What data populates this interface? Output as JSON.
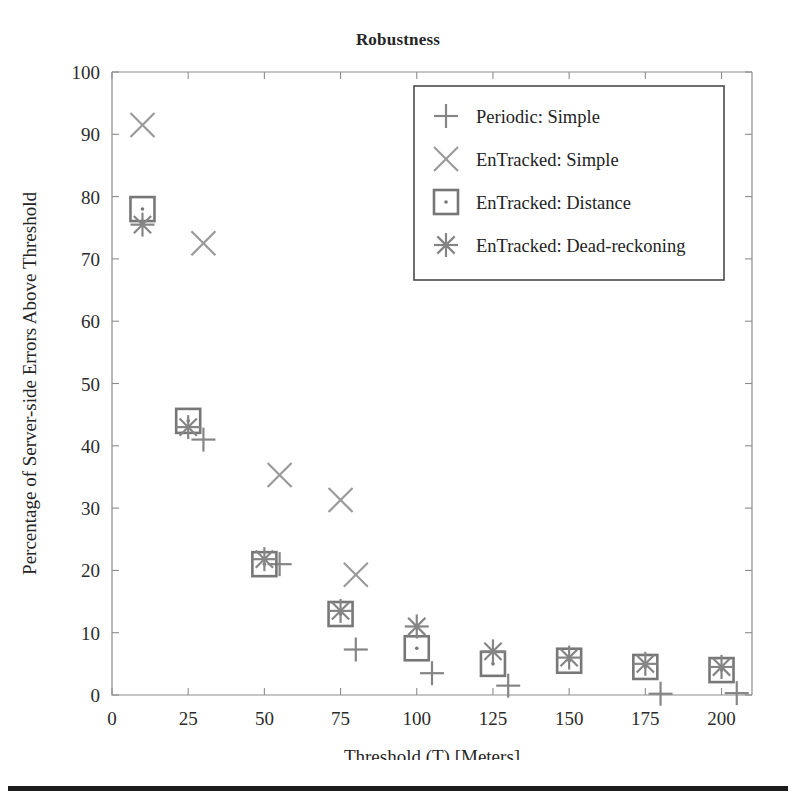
{
  "figure": {
    "title": "Robustness"
  },
  "chart_data": {
    "type": "scatter",
    "title": "Robustness",
    "xlabel": "Threshold (T) [Meters]",
    "ylabel": "Percentage of Server-side Errors Above Threshold",
    "xlim": [
      0,
      210
    ],
    "ylim": [
      0,
      100
    ],
    "xticks": [
      0,
      25,
      50,
      75,
      100,
      125,
      150,
      175,
      200
    ],
    "yticks": [
      0,
      10,
      20,
      30,
      40,
      50,
      60,
      70,
      80,
      90,
      100
    ],
    "xtick_labels": [
      "0",
      "25",
      "50",
      "75",
      "100",
      "125",
      "150",
      "175",
      "200"
    ],
    "ytick_labels": [
      "0",
      "10",
      "20",
      "30",
      "40",
      "50",
      "60",
      "70",
      "80",
      "90",
      "100"
    ],
    "grid": false,
    "legend_position": "upper right",
    "marker_color": "#858585",
    "series": [
      {
        "name": "Periodic: Simple",
        "marker": "plus",
        "color": "#858585",
        "points": [
          {
            "x": 30,
            "y": 41.0
          },
          {
            "x": 55,
            "y": 21.0
          },
          {
            "x": 80,
            "y": 7.3
          },
          {
            "x": 105,
            "y": 3.5
          },
          {
            "x": 130,
            "y": 1.5
          },
          {
            "x": 180,
            "y": 0.2
          },
          {
            "x": 205,
            "y": 0.3
          }
        ]
      },
      {
        "name": "EnTracked: Simple",
        "marker": "cross",
        "color": "#9a9a9a",
        "points": [
          {
            "x": 10,
            "y": 91.5
          },
          {
            "x": 30,
            "y": 72.5
          },
          {
            "x": 55,
            "y": 35.3
          },
          {
            "x": 75,
            "y": 31.3
          },
          {
            "x": 80,
            "y": 19.3
          }
        ]
      },
      {
        "name": "EnTracked: Distance",
        "marker": "square-dot",
        "color": "#777777",
        "points": [
          {
            "x": 10,
            "y": 78.0
          },
          {
            "x": 25,
            "y": 44.0
          },
          {
            "x": 50,
            "y": 21.0
          },
          {
            "x": 75,
            "y": 13.0
          },
          {
            "x": 100,
            "y": 7.5
          },
          {
            "x": 125,
            "y": 5.0
          },
          {
            "x": 150,
            "y": 5.5
          },
          {
            "x": 175,
            "y": 4.5
          },
          {
            "x": 200,
            "y": 4.0
          }
        ]
      },
      {
        "name": "EnTracked: Dead-reckoning",
        "marker": "asterisk",
        "color": "#858585",
        "points": [
          {
            "x": 10,
            "y": 75.5
          },
          {
            "x": 25,
            "y": 43.0
          },
          {
            "x": 50,
            "y": 21.8
          },
          {
            "x": 75,
            "y": 13.5
          },
          {
            "x": 100,
            "y": 11.0
          },
          {
            "x": 125,
            "y": 7.0
          },
          {
            "x": 150,
            "y": 6.0
          },
          {
            "x": 175,
            "y": 5.0
          },
          {
            "x": 200,
            "y": 4.5
          }
        ]
      }
    ],
    "legend_entries": [
      {
        "label": "Periodic: Simple",
        "marker": "plus"
      },
      {
        "label": "EnTracked: Simple",
        "marker": "cross"
      },
      {
        "label": "EnTracked: Distance",
        "marker": "square-dot"
      },
      {
        "label": "EnTracked: Dead-reckoning",
        "marker": "asterisk"
      }
    ]
  }
}
